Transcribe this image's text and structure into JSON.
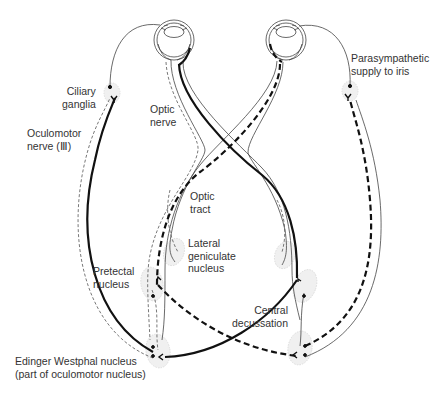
{
  "figure": {
    "type": "pupillary light reflex pathway",
    "colors": {
      "line": "#111111",
      "nucleus_fill": "#f0f0f0",
      "text": "#333333",
      "background": "#ffffff"
    }
  },
  "labels": {
    "ciliary_ganglia": "Ciliary\nganglia",
    "oculomotor_nerve": "Oculomotor\nnerve (Ⅲ)",
    "optic_nerve": "Optic\nnerve",
    "optic_tract": "Optic\ntract",
    "lateral_geniculate": "Lateral\ngeniculate\nnucleus",
    "pretectal_nucleus": "Pretectal\nnucleus",
    "central_decussation": "Central\ndecussation",
    "edinger_westphal": "Edinger Westphal nucleus\n(part of oculomotor nucleus)",
    "parasympathetic": "Parasympathetic\nsupply to iris"
  },
  "legend_lines": {
    "thick_solid": "pathway from left eye",
    "thick_dashed": "pathway from right eye"
  }
}
